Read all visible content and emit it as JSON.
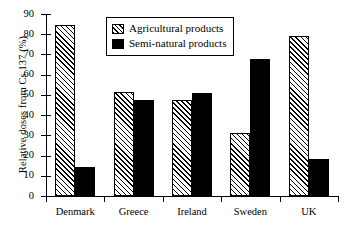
{
  "chart_data": {
    "type": "bar",
    "title": "",
    "xlabel": "",
    "ylabel": "Relative doses from Cs 137 (%)",
    "ylim": [
      0,
      90
    ],
    "ytick_step": 10,
    "yticks": [
      0,
      10,
      20,
      30,
      40,
      50,
      60,
      70,
      80,
      90
    ],
    "grid": false,
    "legend_position": "top-center",
    "categories": [
      "Denmark",
      "Greece",
      "Ireland",
      "Sweden",
      "UK"
    ],
    "series": [
      {
        "name": "Agricultural products",
        "fill": "hatch",
        "values": [
          84.5,
          51.5,
          47.5,
          31,
          79
        ]
      },
      {
        "name": "Semi-natural products",
        "fill": "solid",
        "values": [
          14.5,
          47.5,
          51,
          68,
          18.5
        ]
      }
    ]
  },
  "legend": {
    "items": [
      {
        "label": "Agricultural products",
        "swatch": "hatch-swatch"
      },
      {
        "label": "Semi-natural products",
        "swatch": "solid-swatch"
      }
    ]
  },
  "axis": {
    "y_title": "Relative doses from Cs 137 (%)",
    "y_labels": [
      "90",
      "80",
      "70",
      "60",
      "50",
      "40",
      "30",
      "20",
      "10",
      "0"
    ],
    "x_labels": [
      "Denmark",
      "Greece",
      "Ireland",
      "Sweden",
      "UK"
    ]
  }
}
